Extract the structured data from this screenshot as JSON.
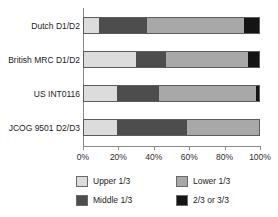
{
  "chart_data": {
    "type": "bar",
    "orientation": "horizontal",
    "stacked": true,
    "stack_mode": "percent",
    "title": "",
    "subtitle": "",
    "xlabel": "",
    "ylabel": "",
    "xlim": [
      0,
      100
    ],
    "grid": false,
    "legend_position": "bottom",
    "categories": [
      "Dutch D1/D2",
      "British MRC D1/D2",
      "US INT0116",
      "JCOG 9501 D2/D3"
    ],
    "xticks": [
      0,
      20,
      40,
      60,
      80,
      100
    ],
    "xtick_labels": [
      "0%",
      "20%",
      "40%",
      "60%",
      "80%",
      "100%"
    ],
    "series": [
      {
        "name": "Upper 1/3",
        "color": "#dcdcdc",
        "values": [
          9,
          30,
          19,
          19
        ]
      },
      {
        "name": "Middle 1/3",
        "color": "#4d4d4d",
        "values": [
          27,
          17,
          24,
          40
        ]
      },
      {
        "name": "Lower 1/3",
        "color": "#a8a8a8",
        "values": [
          55,
          46,
          55,
          41
        ]
      },
      {
        "name": "2/3 or 3/3",
        "color": "#141414",
        "values": [
          9,
          7,
          2,
          0
        ]
      }
    ]
  },
  "legend": {
    "entries": [
      {
        "label": "Upper 1/3",
        "color": "#dcdcdc"
      },
      {
        "label": "Lower 1/3",
        "color": "#a8a8a8"
      },
      {
        "label": "Middle 1/3",
        "color": "#4d4d4d"
      },
      {
        "label": "2/3 or 3/3",
        "color": "#141414"
      }
    ]
  },
  "axis": {
    "axis_color": "#8a8a8a"
  }
}
